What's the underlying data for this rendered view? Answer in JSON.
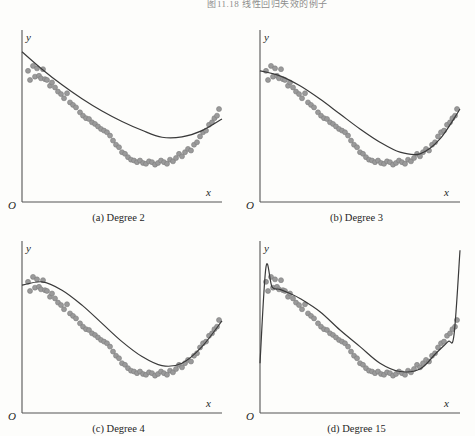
{
  "figure": {
    "header_caption": "图11.18  线性回归失效的例子",
    "background_color": "#fdfdfb",
    "axis_color": "#555555",
    "curve_color": "#3a3a3a",
    "point_color": "#9a9a9a",
    "point_stroke": "#7d7d7d"
  },
  "axes_labels": {
    "x": "x",
    "y": "y",
    "origin": "O"
  },
  "panels": [
    {
      "id": "a",
      "caption": "(a) Degree 2",
      "degree": 2
    },
    {
      "id": "b",
      "caption": "(b) Degree 3",
      "degree": 3
    },
    {
      "id": "c",
      "caption": "(c) Degree 4",
      "degree": 4
    },
    {
      "id": "d",
      "caption": "(d) Degree 15",
      "degree": 15
    }
  ],
  "chart_data": {
    "type": "scatter",
    "title": "图11.18  线性回归失效的例子",
    "xlabel": "x",
    "ylabel": "y",
    "xlim": [
      0,
      1
    ],
    "ylim": [
      0,
      1
    ],
    "grid": false,
    "legend": "none",
    "axis_ticks": "none",
    "note": "2x2 grid of polynomial regression fits of increasing degree on one shared noisy dataset; degree 15 overfits with edge spikes.",
    "scatter_points": {
      "x": [
        0.03,
        0.04,
        0.055,
        0.065,
        0.075,
        0.085,
        0.095,
        0.105,
        0.115,
        0.125,
        0.14,
        0.15,
        0.165,
        0.18,
        0.195,
        0.21,
        0.225,
        0.24,
        0.255,
        0.27,
        0.29,
        0.305,
        0.32,
        0.335,
        0.35,
        0.365,
        0.38,
        0.395,
        0.41,
        0.425,
        0.44,
        0.455,
        0.47,
        0.485,
        0.5,
        0.515,
        0.53,
        0.545,
        0.56,
        0.575,
        0.59,
        0.605,
        0.62,
        0.635,
        0.65,
        0.665,
        0.68,
        0.695,
        0.71,
        0.725,
        0.74,
        0.755,
        0.77,
        0.785,
        0.8,
        0.815,
        0.83,
        0.845,
        0.86,
        0.875,
        0.89,
        0.905,
        0.92,
        0.935,
        0.95,
        0.962,
        0.975,
        0.985
      ],
      "y": [
        0.79,
        0.735,
        0.82,
        0.755,
        0.805,
        0.76,
        0.745,
        0.8,
        0.74,
        0.735,
        0.7,
        0.72,
        0.69,
        0.665,
        0.65,
        0.625,
        0.655,
        0.6,
        0.585,
        0.57,
        0.54,
        0.52,
        0.505,
        0.5,
        0.48,
        0.47,
        0.455,
        0.44,
        0.43,
        0.42,
        0.4,
        0.37,
        0.345,
        0.33,
        0.3,
        0.29,
        0.27,
        0.255,
        0.25,
        0.24,
        0.25,
        0.235,
        0.23,
        0.245,
        0.24,
        0.225,
        0.235,
        0.25,
        0.24,
        0.23,
        0.255,
        0.245,
        0.265,
        0.29,
        0.275,
        0.3,
        0.32,
        0.31,
        0.345,
        0.36,
        0.395,
        0.42,
        0.43,
        0.465,
        0.48,
        0.505,
        0.52,
        0.56
      ]
    },
    "fits": [
      {
        "degree": 2,
        "label": "(a) Degree 2",
        "shape": "parabola opening upward; minimum near x=0.70",
        "curve_y_at": {
          "0.00": 0.905,
          "0.10": 0.8,
          "0.20": 0.706,
          "0.30": 0.622,
          "0.40": 0.548,
          "0.50": 0.485,
          "0.60": 0.432,
          "0.70": 0.39,
          "0.80": 0.392,
          "0.90": 0.43,
          "1.00": 0.5
        }
      },
      {
        "degree": 3,
        "label": "(b) Degree 3",
        "shape": "cubic, gentle plateau at left, minimum near x=0.72, rising right",
        "curve_y_at": {
          "0.00": 0.79,
          "0.10": 0.76,
          "0.20": 0.7,
          "0.30": 0.62,
          "0.40": 0.53,
          "0.50": 0.44,
          "0.60": 0.36,
          "0.70": 0.3,
          "0.80": 0.29,
          "0.90": 0.38,
          "1.00": 0.56
        }
      },
      {
        "degree": 4,
        "label": "(c) Degree 4",
        "shape": "S-shaped; flat crest near x=0.10, steep descent, minimum near x=0.72",
        "curve_y_at": {
          "0.00": 0.77,
          "0.10": 0.79,
          "0.20": 0.74,
          "0.30": 0.65,
          "0.40": 0.54,
          "0.50": 0.43,
          "0.60": 0.34,
          "0.70": 0.285,
          "0.80": 0.3,
          "0.90": 0.4,
          "1.00": 0.555
        }
      },
      {
        "degree": 15,
        "label": "(d) Degree 15",
        "shape": "overfit: sharp spike at left edge, wiggles through middle, near-vertical blow-up at right edge",
        "curve_y_at": {
          "0.00": 0.3,
          "0.03": 0.88,
          "0.06": 0.76,
          "0.10": 0.745,
          "0.15": 0.72,
          "0.20": 0.69,
          "0.30": 0.61,
          "0.40": 0.5,
          "0.50": 0.4,
          "0.60": 0.3,
          "0.70": 0.25,
          "0.80": 0.265,
          "0.88": 0.36,
          "0.94": 0.43,
          "0.97": 0.47,
          "1.00": 0.98
        }
      }
    ]
  }
}
